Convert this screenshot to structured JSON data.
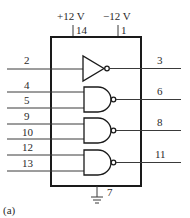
{
  "diagram": {
    "caption": "(a)",
    "power": {
      "positive": {
        "label": "+12 V",
        "pin": "14"
      },
      "negative": {
        "label": "−12 V",
        "pin": "1"
      }
    },
    "ground": {
      "pin": "7",
      "icon": "ground-icon"
    },
    "gates": [
      {
        "type": "inverter",
        "inputs": [
          "2"
        ],
        "output": "3"
      },
      {
        "type": "nand",
        "inputs": [
          "4",
          "5"
        ],
        "output": "6"
      },
      {
        "type": "nand",
        "inputs": [
          "9",
          "10"
        ],
        "output": "8"
      },
      {
        "type": "nand",
        "inputs": [
          "12",
          "13"
        ],
        "output": "11"
      }
    ],
    "colors": {
      "ink": "#1a1a1a",
      "background": "#ffffff"
    }
  }
}
